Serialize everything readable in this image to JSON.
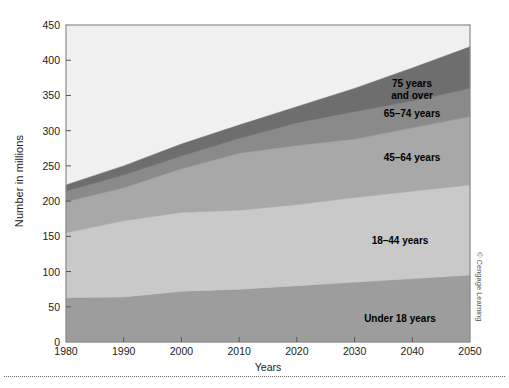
{
  "chart_data": {
    "type": "area",
    "title": "",
    "subtitle": "",
    "xlabel": "Years",
    "ylabel": "Number in millions",
    "xlim": [
      1980,
      2050
    ],
    "ylim": [
      0,
      450
    ],
    "ytick_step": 50,
    "xtick_step": 10,
    "grid": false,
    "legend_position": "inline-annotations",
    "stacked": true,
    "x": [
      1980,
      1990,
      2000,
      2010,
      2020,
      2030,
      2040,
      2050
    ],
    "xtick_labels": [
      "1980",
      "1990",
      "2000",
      "2010",
      "2020",
      "2030",
      "2040",
      "2050"
    ],
    "ytick_labels": [
      "0",
      "50",
      "100",
      "150",
      "200",
      "250",
      "300",
      "350",
      "400",
      "450"
    ],
    "series": [
      {
        "name": "Under 18 years",
        "color": "#9d9d9d",
        "values": [
          63,
          64,
          72,
          75,
          80,
          85,
          90,
          95
        ]
      },
      {
        "name": "18–44 years",
        "color": "#c9c9c9",
        "values": [
          92,
          108,
          112,
          112,
          115,
          120,
          124,
          128
        ]
      },
      {
        "name": "45–64 years",
        "color": "#a8a8a8",
        "values": [
          44,
          47,
          62,
          81,
          84,
          83,
          90,
          97
        ]
      },
      {
        "name": "65–74 years",
        "color": "#8a8a8a",
        "values": [
          15,
          18,
          18,
          21,
          32,
          39,
          38,
          40
        ]
      },
      {
        "name": "75 years\nand over",
        "color": "#6e6e6e",
        "values": [
          9,
          13,
          17,
          19,
          23,
          33,
          47,
          59
        ]
      }
    ],
    "annotations": [
      {
        "text": "75 years\nand over",
        "x_px": 412,
        "y_px": 78
      },
      {
        "text": "65–74 years",
        "x_px": 412,
        "y_px": 108
      },
      {
        "text": "45–64 years",
        "x_px": 412,
        "y_px": 152
      },
      {
        "text": "18–44 years",
        "x_px": 400,
        "y_px": 235
      },
      {
        "text": "Under 18 years",
        "x_px": 400,
        "y_px": 313
      }
    ],
    "background_color": "#f0f0f0",
    "plot_border_color": "#8c8c8c"
  },
  "credit": {
    "text": "© Cengage Learning"
  }
}
